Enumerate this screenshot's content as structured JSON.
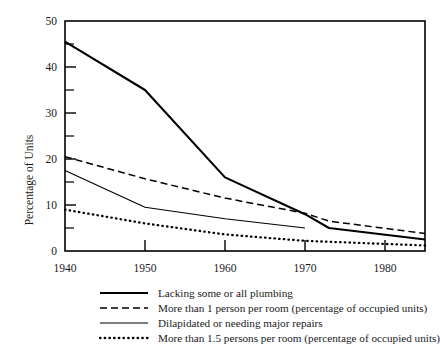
{
  "chart_data": {
    "type": "line",
    "title": "",
    "xlabel": "",
    "ylabel": "Percentage of Units",
    "xlim": [
      1940,
      1985
    ],
    "ylim": [
      0,
      50
    ],
    "grid": false,
    "legend_position": "below",
    "x_ticks": [
      "1940",
      "1950",
      "1960",
      "1970",
      "1980"
    ],
    "x_tick_values": [
      1940,
      1950,
      1960,
      1970,
      1980
    ],
    "y_ticks": [
      "0",
      "10",
      "20",
      "30",
      "40",
      "50"
    ],
    "y_tick_values": [
      0,
      10,
      20,
      30,
      40,
      50
    ],
    "y_minor_tick_values": [
      5,
      15,
      25,
      35,
      45
    ],
    "series": [
      {
        "name": "Lacking some or all plumbing",
        "style": "thick-solid",
        "x": [
          1940,
          1950,
          1960,
          1970,
          1973,
          1985
        ],
        "values": [
          45.5,
          35,
          16,
          8,
          5,
          2.5
        ]
      },
      {
        "name": "More than 1 person per room (percentage of occupied units)",
        "style": "dashed",
        "x": [
          1940,
          1950,
          1960,
          1970,
          1973,
          1985
        ],
        "values": [
          20.5,
          15.7,
          11.5,
          8.2,
          6.5,
          3.8
        ]
      },
      {
        "name": "Dilapidated or needing major repairs",
        "style": "thin-solid",
        "x": [
          1940,
          1950,
          1960,
          1970
        ],
        "values": [
          17.5,
          9.5,
          7,
          5
        ]
      },
      {
        "name": "More than 1.5 persons per room (percentage of occupied units)",
        "style": "dotted",
        "x": [
          1940,
          1950,
          1960,
          1970,
          1985
        ],
        "values": [
          9,
          6,
          3.6,
          2.2,
          1.2
        ]
      }
    ]
  },
  "axes": {
    "ylabel": "Percentage of Units",
    "y_tick_labels": {
      "t0": "0",
      "t10": "10",
      "t20": "20",
      "t30": "30",
      "t40": "40",
      "t50": "50"
    },
    "x_tick_labels": {
      "t1940": "1940",
      "t1950": "1950",
      "t1960": "1960",
      "t1970": "1970",
      "t1980": "1980"
    }
  },
  "legend": {
    "items": [
      {
        "label": "Lacking some or all plumbing",
        "style": "thick-solid"
      },
      {
        "label": "More than 1 person per room (percentage of occupied units)",
        "style": "dashed"
      },
      {
        "label": "Dilapidated or needing major repairs",
        "style": "thin-solid"
      },
      {
        "label": "More than 1.5 persons per room (percentage of occupied units)",
        "style": "dotted"
      }
    ]
  },
  "colors": {
    "ink": "#000000",
    "background": "#ffffff"
  }
}
